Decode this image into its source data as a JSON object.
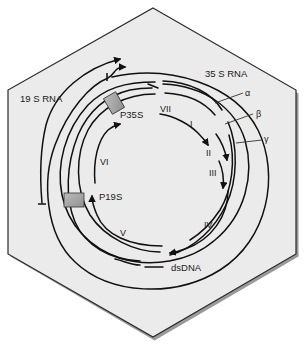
{
  "diagram": {
    "type": "genome-map",
    "shape": "hexagon",
    "colors": {
      "background": "#ffffff",
      "hexagon_fill": "#ebebeb",
      "hexagon_edge": "#2a2a2a",
      "strand": "#111111",
      "promoter_box": "#a6a6a6"
    },
    "labels": {
      "rna_19s": "19 S RNA",
      "rna_35s": "35 S RNA",
      "promoter_35s": "P35S",
      "promoter_19s": "P19S",
      "dsdna": "dsDNA",
      "gap_alpha": "α",
      "gap_beta": "β",
      "gap_gamma": "γ"
    },
    "orfs": [
      {
        "id": "VII",
        "label": "VII"
      },
      {
        "id": "I",
        "label": "I"
      },
      {
        "id": "II",
        "label": "II"
      },
      {
        "id": "III",
        "label": "III"
      },
      {
        "id": "IV",
        "label": "IV"
      },
      {
        "id": "V",
        "label": "V"
      },
      {
        "id": "VI",
        "label": "VI"
      }
    ]
  }
}
